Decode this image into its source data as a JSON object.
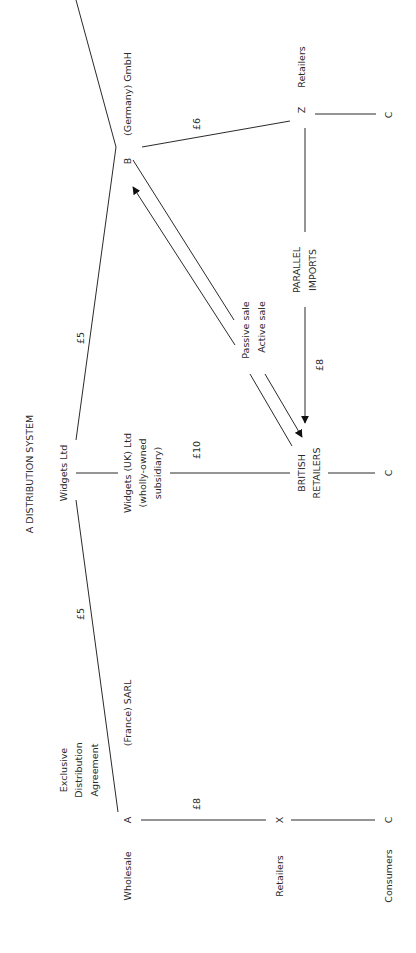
{
  "title": "A DISTRIBUTION SYSTEM",
  "nodes": {
    "widgets_ltd": "Widgets Ltd",
    "uk_subsidiary": [
      "Widgets (UK) Ltd",
      "(wholly-owned",
      "subsidiary)"
    ],
    "british_retailers": [
      "BRITISH",
      "RETAILERS"
    ],
    "germany": "(Germany) GmbH",
    "germany_letter": "B",
    "france": "(France) SARL",
    "france_letter": "A",
    "retailer_x": "X",
    "retailer_z": "Z",
    "consumer_c": "C",
    "exclusive": [
      "Exclusive",
      "Distribution",
      "Agreement"
    ],
    "parallel_imports": [
      "PARALLEL",
      "IMPORTS"
    ],
    "passive_sale": "Passive sale",
    "active_sale": "Active sale"
  },
  "prices": {
    "widgets_to_germany": "£5",
    "widgets_to_france": "£5",
    "uk_to_british": "£10",
    "germany_to_z": "£6",
    "parallel": "£8",
    "france_to_x": "£8"
  },
  "row_labels": {
    "wholesale": "Wholesale",
    "retailers_left": "Retailers",
    "consumers": "Consumers",
    "retailers_right": "Retailers"
  }
}
